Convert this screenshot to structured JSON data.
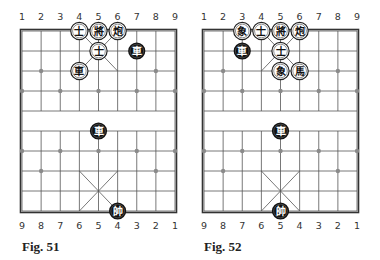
{
  "board_style": {
    "line_color": "#555555",
    "border_color": "#333333",
    "star_color": "#8a8a8a",
    "white_piece_fill": "#ffffff",
    "white_piece_stroke": "#222222",
    "black_piece_fill": "#111111",
    "black_piece_text": "#ffffff"
  },
  "figures": [
    {
      "caption": "Fig. 51",
      "top_labels": [
        "1",
        "2",
        "3",
        "4",
        "5",
        "6",
        "7",
        "8",
        "9"
      ],
      "bottom_labels": [
        "9",
        "8",
        "7",
        "6",
        "5",
        "4",
        "3",
        "2",
        "1"
      ],
      "pieces": [
        {
          "glyph": "士",
          "color": "white",
          "col": 3,
          "row": 0,
          "name": "advisor"
        },
        {
          "glyph": "將",
          "color": "white",
          "col": 4,
          "row": 0,
          "name": "general"
        },
        {
          "glyph": "炮",
          "color": "white",
          "col": 5,
          "row": 0,
          "name": "cannon"
        },
        {
          "glyph": "士",
          "color": "white",
          "col": 4,
          "row": 1,
          "name": "advisor"
        },
        {
          "glyph": "車",
          "color": "black",
          "col": 6,
          "row": 1,
          "name": "chariot"
        },
        {
          "glyph": "車",
          "color": "white",
          "col": 3,
          "row": 2,
          "name": "chariot"
        },
        {
          "glyph": "車",
          "color": "black",
          "col": 4,
          "row": 5,
          "name": "chariot"
        },
        {
          "glyph": "帥",
          "color": "black",
          "col": 5,
          "row": 9,
          "name": "marshal"
        }
      ]
    },
    {
      "caption": "Fig. 52",
      "top_labels": [
        "1",
        "2",
        "3",
        "4",
        "5",
        "6",
        "7",
        "8",
        "9"
      ],
      "bottom_labels": [
        "9",
        "8",
        "7",
        "6",
        "5",
        "4",
        "3",
        "2",
        "1"
      ],
      "pieces": [
        {
          "glyph": "象",
          "color": "white",
          "col": 2,
          "row": 0,
          "name": "elephant"
        },
        {
          "glyph": "士",
          "color": "white",
          "col": 3,
          "row": 0,
          "name": "advisor"
        },
        {
          "glyph": "將",
          "color": "white",
          "col": 4,
          "row": 0,
          "name": "general"
        },
        {
          "glyph": "炮",
          "color": "white",
          "col": 5,
          "row": 0,
          "name": "cannon"
        },
        {
          "glyph": "車",
          "color": "black",
          "col": 2,
          "row": 1,
          "name": "chariot"
        },
        {
          "glyph": "士",
          "color": "white",
          "col": 4,
          "row": 1,
          "name": "advisor"
        },
        {
          "glyph": "象",
          "color": "white",
          "col": 4,
          "row": 2,
          "name": "elephant"
        },
        {
          "glyph": "馬",
          "color": "white",
          "col": 5,
          "row": 2,
          "name": "horse"
        },
        {
          "glyph": "車",
          "color": "black",
          "col": 4,
          "row": 5,
          "name": "chariot"
        },
        {
          "glyph": "帥",
          "color": "black",
          "col": 4,
          "row": 9,
          "name": "marshal"
        }
      ]
    }
  ]
}
